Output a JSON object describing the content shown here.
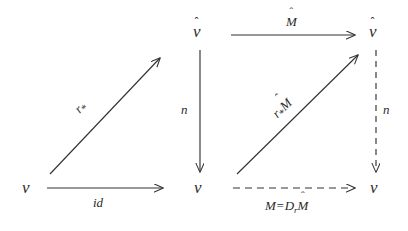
{
  "figure": {
    "kind": "commutative-diagram",
    "title": "",
    "stroke_color": "#333333",
    "text_color": "#2b2b2b",
    "background": "#ffffff"
  },
  "nodes": [
    {
      "id": "left-bottom-V",
      "base": "ᴠ",
      "hat": "",
      "label": "V"
    },
    {
      "id": "mid-top-Vhat",
      "base": "ᴠ",
      "hat": "ˆ",
      "label": "V-hat"
    },
    {
      "id": "mid-bottom-V",
      "base": "ᴠ",
      "hat": "",
      "label": "V"
    },
    {
      "id": "right-top-Vhat",
      "base": "ᴠ",
      "hat": "ˆ",
      "label": "V-hat"
    },
    {
      "id": "right-bottom-V",
      "base": "ᴠ",
      "hat": "",
      "label": "V"
    }
  ],
  "edges": {
    "left_diagonal": {
      "label_base": "r",
      "label_sub": "*",
      "label_hat": "",
      "style": "solid",
      "name": "r-star"
    },
    "left_horizontal": {
      "label": "id",
      "style": "solid",
      "name": "id"
    },
    "mid_vertical": {
      "label": "n",
      "style": "solid",
      "name": "n"
    },
    "right_top": {
      "label_base": "M",
      "label_hat": "ˆ",
      "style": "solid",
      "name": "M-hat"
    },
    "right_diagonal": {
      "label_base": "r",
      "label_sub": "*",
      "label_tail": "M",
      "label_hat": "ˆ",
      "style": "solid",
      "name": "r-star-M-hat"
    },
    "right_vertical": {
      "label": "n",
      "style": "dashed",
      "name": "n"
    },
    "right_bottom": {
      "label_lhs": "M",
      "label_eq": "=",
      "label_rhs_base": "D",
      "label_rhs_sub": "r",
      "label_rhs_tail": "M",
      "label_rhs_hat": "ˆ",
      "style": "dashed",
      "name": "M-equals-Dr-M-hat"
    }
  },
  "labels": {
    "id": "id",
    "n_left": "n",
    "n_right": "n",
    "r_star": "r",
    "r_star_sub": "*",
    "M_hat": "M",
    "hat_glyph": "ˆ",
    "r_star_M_base": "r",
    "r_star_M_sub": "*",
    "r_star_M_tail": "M",
    "M_eq_lhs": "M",
    "M_eq_sign": "=",
    "M_eq_D": "D",
    "M_eq_D_sub": "r",
    "M_eq_Mhat": "M"
  }
}
